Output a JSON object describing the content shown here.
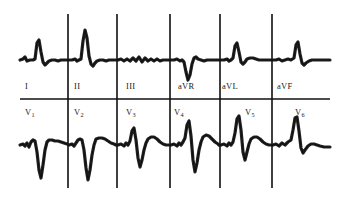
{
  "document": {
    "kind": "12-lead electrocardiogram strip",
    "background_color": "#ffffff",
    "trace_color": "#101010",
    "grid_color": "#101010"
  },
  "labels": {
    "top_row": [
      {
        "name": "lead-I",
        "text": "I",
        "sub": "",
        "x": 25
      },
      {
        "name": "lead-II",
        "text": "II",
        "sub": "",
        "x": 74
      },
      {
        "name": "lead-III",
        "text": "III",
        "sub": "",
        "x": 126
      },
      {
        "name": "lead-aVR",
        "text": "aVR",
        "sub": "",
        "x": 178
      },
      {
        "name": "lead-aVL",
        "text": "aVL",
        "sub": "",
        "x": 222
      },
      {
        "name": "lead-aVF",
        "text": "aVF",
        "sub": "",
        "x": 277
      }
    ],
    "bottom_row": [
      {
        "name": "lead-V1",
        "text": "V",
        "sub": "1",
        "x": 25
      },
      {
        "name": "lead-V2",
        "text": "V",
        "sub": "2",
        "x": 74
      },
      {
        "name": "lead-V3",
        "text": "V",
        "sub": "3",
        "x": 126
      },
      {
        "name": "lead-V4",
        "text": "V",
        "sub": "4",
        "x": 174
      },
      {
        "name": "lead-V5",
        "text": "V",
        "sub": "5",
        "x": 245
      },
      {
        "name": "lead-V6",
        "text": "V",
        "sub": "6",
        "x": 295
      }
    ]
  },
  "chart_data": {
    "type": "line",
    "xlabel": "",
    "ylabel": "",
    "grid": true,
    "legend": "none",
    "layout": {
      "rows": 2,
      "leads_per_row": 6,
      "separator_line_y": 99,
      "separator_line_x_start": 20,
      "separator_line_x_end": 330,
      "column_divider_x": [
        68,
        117,
        170,
        220,
        272
      ],
      "column_divider_top_y_start": 14,
      "column_divider_top_y_end": 99,
      "column_divider_bottom_y_start": 99,
      "column_divider_bottom_y_end": 188,
      "top_row_baseline_y": 60,
      "bottom_row_baseline_y": 145,
      "trace_x_start": 20,
      "trace_x_end": 330
    },
    "series": [
      {
        "name": "I",
        "row": "top",
        "baseline_y": 60,
        "points": "20,60 23,59 25,57 27,61 30,60 33,60 35,59 37,43 39,40 41,52 43,62 45,65 47,63 49,61 52,60 55,60 58,61 61,60 64,60 67,60"
      },
      {
        "name": "II",
        "row": "top",
        "baseline_y": 60,
        "points": "69,60 72,60 75,59 77,61 79,60 81,59 83,41 85,30 87,38 89,56 91,64 93,66 95,63 97,61 100,60 103,60 106,61 109,60 112,60 116,60"
      },
      {
        "name": "III",
        "row": "top",
        "baseline_y": 60,
        "points": "118,60 121,59 124,61 127,59 130,61 133,58 136,61 139,57 142,62 145,58 148,61 151,59 154,61 157,59 160,61 163,60 166,60 169,60"
      },
      {
        "name": "aVR",
        "row": "top",
        "baseline_y": 60,
        "points": "171,60 174,60 177,59 180,61 182,60 184,62 186,72 188,80 190,75 192,64 194,58 196,57 198,59 201,60 204,61 207,60 210,60 213,60 216,60 219,60"
      },
      {
        "name": "aVL",
        "row": "top",
        "baseline_y": 60,
        "points": "221,60 224,60 227,59 229,61 231,60 233,58 235,46 237,43 239,52 241,62 243,64 245,62 247,59 250,58 253,58 256,59 259,60 262,60 265,60 268,60 271,60"
      },
      {
        "name": "aVF",
        "row": "top",
        "baseline_y": 60,
        "points": "273,60 276,60 279,59 282,61 285,60 288,59 291,60 294,58 296,45 298,42 300,54 302,63 304,65 306,63 309,61 312,60 315,60 318,60 322,60 326,60 330,60"
      },
      {
        "name": "V1",
        "row": "bottom",
        "baseline_y": 145,
        "points": "20,145 23,144 25,146 27,143 29,147 31,142 33,140 35,141 37,152 39,170 41,178 43,165 45,150 47,142 49,140 52,140 55,141 58,141 61,142 64,143 67,144"
      },
      {
        "name": "V2",
        "row": "bottom",
        "baseline_y": 145,
        "points": "69,145 72,144 74,146 76,143 78,140 80,139 82,140 84,150 86,168 88,180 90,170 92,155 94,145 96,139 99,138 102,138 105,139 108,141 111,143 114,144 116,145"
      },
      {
        "name": "V3",
        "row": "bottom",
        "baseline_y": 145,
        "points": "118,145 121,144 124,146 126,143 128,145 130,141 132,131 134,128 136,140 138,158 140,167 142,160 144,150 146,143 148,139 151,137 154,137 157,139 160,142 163,144 166,145 169,145"
      },
      {
        "name": "V4",
        "row": "bottom",
        "baseline_y": 145,
        "points": "171,145 174,144 177,146 179,143 181,145 183,142 185,138 187,125 189,121 191,136 193,160 195,172 197,163 199,150 201,142 203,137 206,135 209,136 212,139 215,142 218,144 219,145"
      },
      {
        "name": "V5",
        "row": "bottom",
        "baseline_y": 145,
        "points": "221,145 224,144 227,146 229,143 231,145 233,142 235,133 237,119 239,116 241,130 243,152 245,160 247,152 249,144 251,139 254,137 257,137 260,139 263,142 266,144 269,145 271,145"
      },
      {
        "name": "V6",
        "row": "bottom",
        "baseline_y": 145,
        "points": "273,145 276,144 279,146 282,143 285,145 288,142 291,140 293,130 295,118 297,117 299,131 301,148 303,153 305,150 308,146 311,144 314,144 317,145 320,146 324,147 327,147 330,147"
      }
    ]
  }
}
